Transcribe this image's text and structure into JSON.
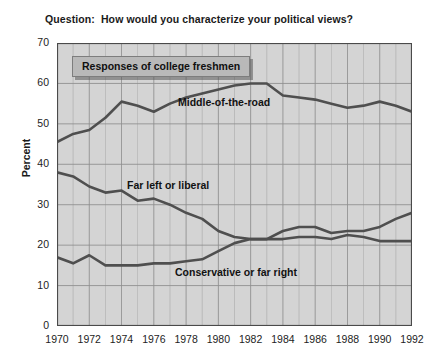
{
  "question": {
    "text": "Question:  How would you characterize your political views?"
  },
  "legend": {
    "text": "Responses of college freshmen"
  },
  "axes": {
    "ylabel": "Percent",
    "yticks": [
      "0",
      "10",
      "20",
      "30",
      "40",
      "50",
      "60",
      "70"
    ],
    "xticks": [
      "1970",
      "1972",
      "1974",
      "1976",
      "1978",
      "1980",
      "1982",
      "1984",
      "1986",
      "1988",
      "1990",
      "1992"
    ]
  },
  "series_labels": {
    "middle": "Middle-of-the-road",
    "liberal": "Far left or liberal",
    "conservative": "Conservative or far right"
  },
  "colors": {
    "plot_background": "#d4d4d4",
    "grid": "#8e8e8e",
    "axis": "#4a4a4a",
    "line": "#4f4f4f",
    "legend_fill": "#b9b9b9",
    "text": "#1a1a1a"
  },
  "chart_data": {
    "type": "line",
    "title": "Question:  How would you characterize your political views?",
    "subtitle": "Responses of college freshmen",
    "xlabel": "",
    "ylabel": "Percent",
    "xlim": [
      1970,
      1992
    ],
    "ylim": [
      0,
      70
    ],
    "grid": true,
    "legend_position": "inline-annotations",
    "x": [
      1970,
      1971,
      1972,
      1973,
      1974,
      1975,
      1976,
      1977,
      1978,
      1979,
      1980,
      1981,
      1982,
      1983,
      1984,
      1985,
      1986,
      1987,
      1988,
      1989,
      1990,
      1991,
      1992
    ],
    "series": [
      {
        "name": "Middle-of-the-road",
        "values": [
          45.5,
          47.5,
          48.5,
          51.5,
          55.5,
          54.5,
          53.0,
          55.0,
          56.5,
          57.5,
          58.5,
          59.5,
          60.0,
          60.0,
          57.0,
          56.5,
          56.0,
          55.0,
          54.0,
          54.5,
          55.5,
          54.5,
          53.0
        ]
      },
      {
        "name": "Far left or liberal",
        "values": [
          38.0,
          37.0,
          34.5,
          33.0,
          33.5,
          31.0,
          31.5,
          30.0,
          28.0,
          26.5,
          23.5,
          22.0,
          21.5,
          21.5,
          21.5,
          22.0,
          22.0,
          21.5,
          22.5,
          22.0,
          21.0,
          21.0,
          21.0
        ]
      },
      {
        "name": "Conservative or far right",
        "values": [
          17.0,
          15.5,
          17.5,
          15.0,
          15.0,
          15.0,
          15.5,
          15.5,
          16.0,
          16.5,
          18.5,
          20.5,
          21.5,
          21.5,
          23.5,
          24.5,
          24.5,
          23.0,
          23.5,
          23.5,
          24.5,
          26.5,
          28.0
        ]
      }
    ]
  }
}
